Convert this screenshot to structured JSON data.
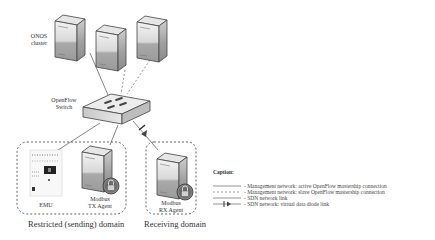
{
  "labels": {
    "onos_cluster": [
      "ONOS",
      "cluster"
    ],
    "openflow_switch": [
      "OpenFlow",
      "Switch"
    ],
    "emu": "EMU",
    "modbus_tx": [
      "Modbus",
      "TX Agent"
    ],
    "modbus_rx": [
      "Modbus",
      "RX Agent"
    ]
  },
  "domains": {
    "restricted": "Restricted (sending) domain",
    "receiving": "Receiving domain"
  },
  "caption": {
    "title": "Caption:",
    "items": [
      {
        "style": "solid",
        "text": "- Management network: active OpenFlow mastership connection"
      },
      {
        "style": "dashed",
        "text": "- Management network: slave OpenFlow mastership connection"
      },
      {
        "style": "solid",
        "text": "- SDN network link"
      },
      {
        "style": "diode",
        "text": "- SDN network: virtual data diode link"
      }
    ]
  }
}
